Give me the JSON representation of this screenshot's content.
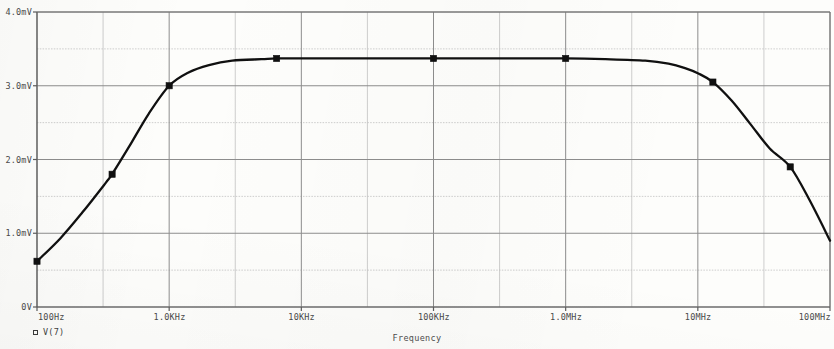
{
  "legend": {
    "marker_icon": "square-marker-icon",
    "label": "V(7)"
  },
  "axis_title": "Frequency",
  "colors": {
    "background": "#fdfdfb",
    "curve": "#101010",
    "major_grid": "#8d8d8d",
    "minor_grid": "#c2c2c2",
    "frame": "#6e6e6e",
    "text": "#4a4a4a"
  },
  "chart_data": {
    "type": "line",
    "title": "",
    "subtitle": "",
    "xlabel": "Frequency",
    "ylabel": "",
    "xscale": "log",
    "yscale": "linear",
    "xlim": [
      100,
      100000000
    ],
    "ylim": [
      0,
      4
    ],
    "grid": true,
    "minor_grid": true,
    "legend_position": "bottom-left",
    "xtick_labels": [
      "100Hz",
      "1.0KHz",
      "10KHz",
      "100KHz",
      "1.0MHz",
      "10MHz",
      "100MHz"
    ],
    "xtick_values": [
      100,
      1000,
      10000,
      100000,
      1000000,
      10000000,
      100000000
    ],
    "ytick_labels": [
      "0V",
      "1.0mV",
      "2.0mV",
      "3.0mV",
      "4.0mV"
    ],
    "ytick_values": [
      0,
      1,
      2,
      3,
      4
    ],
    "y_unit": "mV",
    "series": [
      {
        "name": "V(7)",
        "marker": "square",
        "x": [
          100,
          150,
          220,
          330,
          370,
          500,
          700,
          1000,
          1400,
          2000,
          3000,
          5000,
          6500,
          10000,
          20000,
          50000,
          100000,
          300000,
          1000000,
          2000000,
          4000000,
          6000000,
          8000000,
          10000000,
          13000000,
          18000000,
          25000000,
          35000000,
          50000000,
          70000000,
          100000000
        ],
        "y": [
          0.62,
          0.93,
          1.28,
          1.68,
          1.8,
          2.18,
          2.62,
          3.0,
          3.18,
          3.28,
          3.34,
          3.36,
          3.37,
          3.37,
          3.37,
          3.37,
          3.37,
          3.37,
          3.37,
          3.36,
          3.34,
          3.3,
          3.24,
          3.17,
          3.05,
          2.8,
          2.48,
          2.15,
          1.9,
          1.45,
          0.9
        ],
        "marker_points": [
          {
            "x": 100,
            "y": 0.62
          },
          {
            "x": 370,
            "y": 1.8
          },
          {
            "x": 1000,
            "y": 3.0
          },
          {
            "x": 6500,
            "y": 3.37
          },
          {
            "x": 100000,
            "y": 3.37
          },
          {
            "x": 1000000,
            "y": 3.37
          },
          {
            "x": 13000000,
            "y": 3.05
          },
          {
            "x": 50000000,
            "y": 1.9
          }
        ]
      }
    ]
  }
}
